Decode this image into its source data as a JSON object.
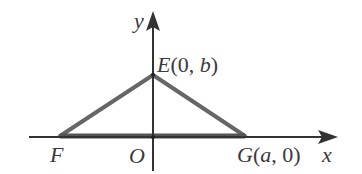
{
  "diagram": {
    "type": "coordinate-geometry",
    "axes": {
      "x_label": "x",
      "y_label": "y",
      "origin_label": "O"
    },
    "points": [
      {
        "name": "E",
        "label": "E(0, b)",
        "coords": "(0, b)"
      },
      {
        "name": "F",
        "label": "F",
        "coords": null
      },
      {
        "name": "G",
        "label": "G(a, 0)",
        "coords": "(a, 0)"
      }
    ],
    "shape": "triangle EFG",
    "colors": {
      "axis": "#333333",
      "triangle": "#666666",
      "text": "#3a3a3a",
      "background": "#ffffff"
    }
  },
  "labels": {
    "y": "y",
    "x": "x",
    "O": "O",
    "F": "F",
    "E_letter": "E",
    "E_open": "(0, ",
    "E_b": "b",
    "E_close": ")",
    "G_letter": "G",
    "G_open": "(",
    "G_a": "a",
    "G_rest": ", 0)"
  }
}
